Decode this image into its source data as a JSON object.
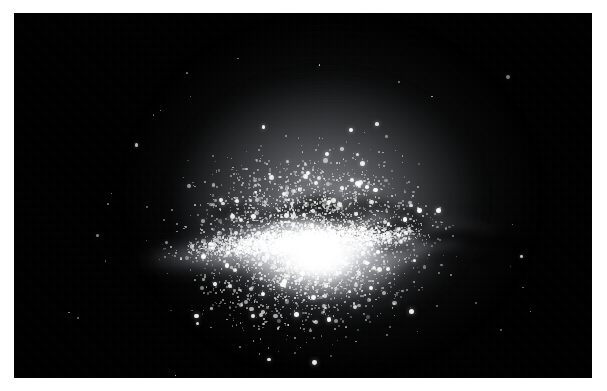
{
  "page": {
    "width": 607,
    "height": 391,
    "background_color": "#ffffff"
  },
  "photo": {
    "subject": "edge-on spiral galaxy star field",
    "alt_text": "Grayscale astronomical photograph of an edge-on spiral galaxy with a bright central bulge, a horizontal galactic plane crossed by dark dust lanes, and a spherical halo of individually resolved stars fading into a black sky.",
    "palette": {
      "sky": "#000000",
      "core": "#ffffff",
      "halo": "#b9bcc2",
      "dust": "#050505",
      "margin": "#ffffff"
    },
    "plate": {
      "left": 14,
      "top": 13,
      "width": 578,
      "height": 365
    },
    "galaxy": {
      "core_center_x": 307,
      "core_center_y": 241,
      "plane_tilt_degrees": -4.2,
      "halo_left": 132,
      "halo_right": 518,
      "halo_top": 32,
      "halo_bottom": 352
    }
  }
}
